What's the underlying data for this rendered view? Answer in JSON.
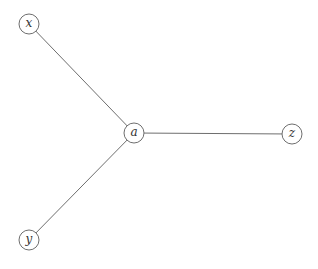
{
  "diagram": {
    "type": "graph",
    "nodes": [
      {
        "id": "x",
        "label": "x",
        "cx": 29,
        "cy": 24
      },
      {
        "id": "a",
        "label": "a",
        "cx": 134,
        "cy": 133
      },
      {
        "id": "z",
        "label": "z",
        "cx": 292,
        "cy": 134
      },
      {
        "id": "y",
        "label": "y",
        "cx": 29,
        "cy": 240
      }
    ],
    "edges": [
      {
        "from": "x",
        "to": "a"
      },
      {
        "from": "a",
        "to": "z"
      },
      {
        "from": "y",
        "to": "a"
      }
    ],
    "node_radius": 10,
    "colors": {
      "stroke": "#6e6e6e",
      "label": "#333333",
      "background": "#ffffff"
    }
  }
}
